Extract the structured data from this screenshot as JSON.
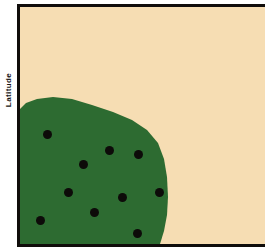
{
  "figure": {
    "type": "distribution-map",
    "y_axis_label": "Latitude",
    "background_color": "#f6ddb3",
    "frame_color": "#100d0b",
    "region_color": "#2d6b31",
    "dot_color": "#0d0b09"
  },
  "chart_data": {
    "type": "scatter",
    "title": "",
    "xlabel": "",
    "ylabel": "Latitude",
    "xlim": [
      0,
      249
    ],
    "ylim": [
      0,
      240
    ],
    "grid": false,
    "legend": null,
    "series": [
      {
        "name": "Sample localities",
        "marker": "filled-circle",
        "color": "#0d0b09",
        "points": [
          {
            "x": 27,
            "y": 127
          },
          {
            "x": 89,
            "y": 143
          },
          {
            "x": 118,
            "y": 147
          },
          {
            "x": 63,
            "y": 157
          },
          {
            "x": 48,
            "y": 185
          },
          {
            "x": 102,
            "y": 190
          },
          {
            "x": 139,
            "y": 185
          },
          {
            "x": 74,
            "y": 205
          },
          {
            "x": 20,
            "y": 213
          },
          {
            "x": 117,
            "y": 226
          }
        ]
      }
    ],
    "shaded_region": {
      "name": "Shaded range polygon",
      "color": "#2d6b31",
      "vertices": [
        {
          "x": 0,
          "y": 102
        },
        {
          "x": 6,
          "y": 96
        },
        {
          "x": 17,
          "y": 92
        },
        {
          "x": 33,
          "y": 90
        },
        {
          "x": 52,
          "y": 92
        },
        {
          "x": 72,
          "y": 98
        },
        {
          "x": 93,
          "y": 105
        },
        {
          "x": 112,
          "y": 113
        },
        {
          "x": 127,
          "y": 123
        },
        {
          "x": 138,
          "y": 136
        },
        {
          "x": 144,
          "y": 152
        },
        {
          "x": 147,
          "y": 170
        },
        {
          "x": 148,
          "y": 190
        },
        {
          "x": 147,
          "y": 208
        },
        {
          "x": 144,
          "y": 224
        },
        {
          "x": 140,
          "y": 237
        },
        {
          "x": 0,
          "y": 237
        }
      ]
    }
  }
}
